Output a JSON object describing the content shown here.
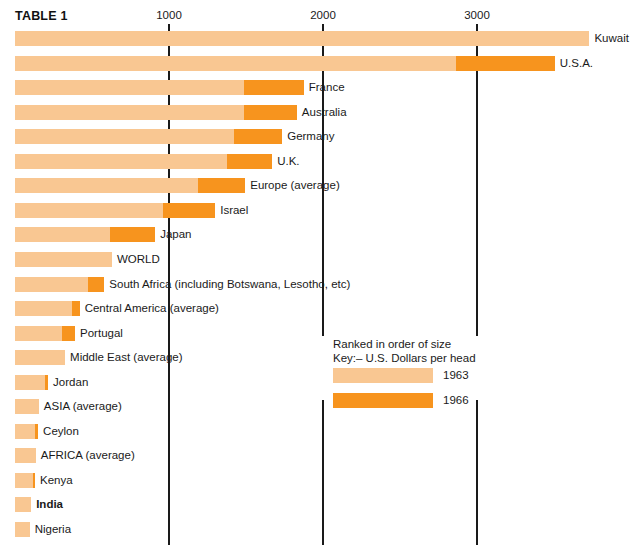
{
  "title": "TABLE 1",
  "colors": {
    "light_1963": "#f9c792",
    "dark_1966": "#f7941e",
    "axis": "#1a1a1a",
    "text": "#1a1a1a",
    "background": "#ffffff"
  },
  "legend": {
    "note_line1": "Ranked in order of size",
    "note_line2": "Key:– U.S. Dollars per head",
    "entries": [
      {
        "label": "1963",
        "swatch": "light"
      },
      {
        "label": "1966",
        "swatch": "dark"
      }
    ]
  },
  "chart_data": {
    "type": "bar",
    "orientation": "horizontal",
    "title": "TABLE 1",
    "subtitle": "Ranked in order of size",
    "xlabel": "U.S. Dollars per head",
    "ylabel": "",
    "xlim": [
      0,
      3800
    ],
    "ticks": [
      1000,
      2000,
      3000
    ],
    "tick_labels": [
      "1000",
      "2000",
      "3000"
    ],
    "grid": false,
    "legend_position": "middle-right",
    "series": [
      {
        "name": "1963",
        "color": "#f9c792"
      },
      {
        "name": "1966",
        "color": "#f7941e"
      }
    ],
    "categories": [
      "Kuwait",
      "U.S.A.",
      "France",
      "Australia",
      "Germany",
      "U.K.",
      "Europe (average)",
      "Israel",
      "Japan",
      "WORLD",
      "South Africa (including Botswana, Lesotho, etc)",
      "Central America (average)",
      "Portugal",
      "Middle East (average)",
      "Jordan",
      "ASIA (average)",
      "Ceylon",
      "AFRICA (average)",
      "Kenya",
      "India",
      "Nigeria"
    ],
    "rows": [
      {
        "label": "Kuwait",
        "v1963": 3730,
        "v1966": 3730,
        "bold": false
      },
      {
        "label": "U.S.A.",
        "v1963": 2865,
        "v1966": 3505,
        "bold": false
      },
      {
        "label": "France",
        "v1963": 1490,
        "v1966": 1875,
        "bold": false
      },
      {
        "label": "Australia",
        "v1963": 1490,
        "v1966": 1830,
        "bold": false
      },
      {
        "label": "Germany",
        "v1963": 1420,
        "v1966": 1735,
        "bold": false
      },
      {
        "label": "U.K.",
        "v1963": 1375,
        "v1966": 1670,
        "bold": false
      },
      {
        "label": "Europe (average)",
        "v1963": 1190,
        "v1966": 1495,
        "bold": false
      },
      {
        "label": "Israel",
        "v1963": 960,
        "v1966": 1300,
        "bold": false
      },
      {
        "label": "Japan",
        "v1963": 615,
        "v1966": 910,
        "bold": false
      },
      {
        "label": "WORLD",
        "v1963": 630,
        "v1966": 630,
        "bold": false
      },
      {
        "label": "South Africa (including Botswana, Lesotho, etc)",
        "v1963": 475,
        "v1966": 580,
        "bold": false
      },
      {
        "label": "Central America (average)",
        "v1963": 370,
        "v1966": 420,
        "bold": false
      },
      {
        "label": "Portugal",
        "v1963": 305,
        "v1966": 390,
        "bold": false
      },
      {
        "label": "Middle East (average)",
        "v1963": 325,
        "v1966": 325,
        "bold": false
      },
      {
        "label": "Jordan",
        "v1963": 195,
        "v1966": 215,
        "bold": false
      },
      {
        "label": "ASIA (average)",
        "v1963": 155,
        "v1966": 155,
        "bold": false
      },
      {
        "label": "Ceylon",
        "v1963": 130,
        "v1966": 150,
        "bold": false
      },
      {
        "label": "AFRICA (average)",
        "v1963": 135,
        "v1966": 135,
        "bold": false
      },
      {
        "label": "Kenya",
        "v1963": 115,
        "v1966": 130,
        "bold": false
      },
      {
        "label": "India",
        "v1963": 105,
        "v1966": 105,
        "bold": true
      },
      {
        "label": "Nigeria",
        "v1963": 95,
        "v1966": 95,
        "bold": false
      }
    ]
  },
  "axis_lines": [
    {
      "value": 1000,
      "top": 24,
      "bottom": 545
    },
    {
      "value": 2000,
      "top": 24,
      "bottom": 336
    },
    {
      "value": 3000,
      "top": 24,
      "bottom": 336
    },
    {
      "value": 2000,
      "top": 400,
      "bottom": 545
    },
    {
      "value": 3000,
      "top": 400,
      "bottom": 545
    }
  ]
}
